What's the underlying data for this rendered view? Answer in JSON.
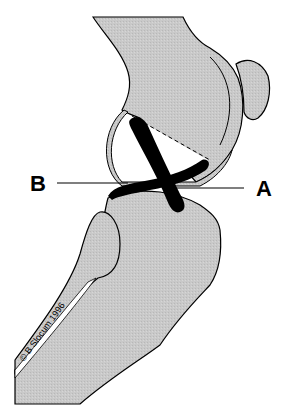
{
  "figure": {
    "labels": {
      "a": "A",
      "b": "B"
    },
    "credit": "© B Slocum 1996",
    "colors": {
      "bone_fill": "#c8c8c8",
      "outline": "#000000",
      "ligament": "#000000",
      "background": "#ffffff"
    }
  }
}
